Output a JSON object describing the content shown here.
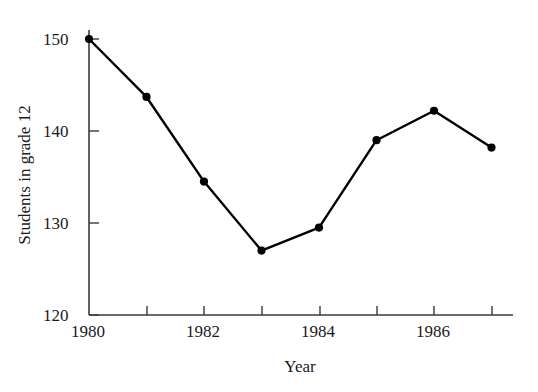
{
  "chart_data": {
    "type": "line",
    "title": "",
    "xlabel": "Year",
    "ylabel": "Students in grade 12",
    "x": [
      1980,
      1981,
      1982,
      1983,
      1984,
      1985,
      1986,
      1987
    ],
    "values": [
      150.0,
      143.7,
      134.5,
      127.0,
      129.5,
      139.0,
      142.2,
      138.2
    ],
    "series": [
      {
        "name": "Students in grade 12",
        "values": [
          150.0,
          143.7,
          134.5,
          127.0,
          129.5,
          139.0,
          142.2,
          138.2
        ]
      }
    ],
    "xlim": [
      1980,
      1987.35
    ],
    "ylim": [
      120,
      150
    ],
    "ytick_values": [
      120,
      130,
      140,
      150
    ],
    "ytick_labels": [
      "120",
      "130",
      "140",
      "150"
    ],
    "xtick_values": [
      1980,
      1981,
      1982,
      1983,
      1984,
      1985,
      1986,
      1987
    ],
    "xtick_labels": [
      "1980",
      "",
      "1982",
      "",
      "1984",
      "",
      "1986",
      ""
    ],
    "xtick_labeled": [
      {
        "value": 1980,
        "label": "1980"
      },
      {
        "value": 1982,
        "label": "1982"
      },
      {
        "value": 1984,
        "label": "1984"
      },
      {
        "value": 1986,
        "label": "1986"
      }
    ],
    "grid": false,
    "legend": "none",
    "line_color": "#000000",
    "marker": "circle",
    "marker_color": "#000000",
    "background_color": "#ffffff",
    "axis_color": "#3a3a3a"
  },
  "axis": {
    "y_tick_120": "120",
    "y_tick_130": "130",
    "y_tick_140": "140",
    "y_tick_150": "150",
    "x_tick_1980": "1980",
    "x_tick_1982": "1982",
    "x_tick_1984": "1984",
    "x_tick_1986": "1986",
    "x_axis_title": "Year",
    "y_axis_title": "Students in grade 12"
  }
}
